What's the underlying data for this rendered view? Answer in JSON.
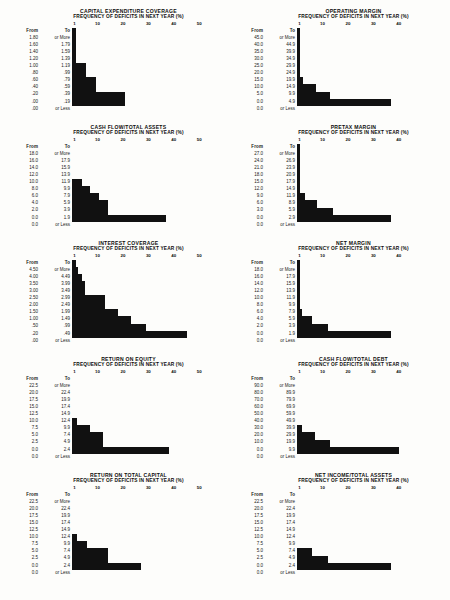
{
  "page": {
    "axis_label": "FREQUENCY OF DEFICITS IN NEXT YEAR  (%)",
    "col_from": "From",
    "col_to": "To",
    "or_more": "or More",
    "or_less": "or Less",
    "bar_color": "#111111",
    "background": "#fdfdfb"
  },
  "chart_data": [
    {
      "id": "capital-expenditure-coverage",
      "type": "bar",
      "orientation": "horizontal",
      "title": "CAPITAL EXPENDITURE COVERAGE",
      "subtitle": "FREQUENCY OF DEFICITS IN NEXT YEAR  (%)",
      "xlabel": "FREQUENCY OF DEFICITS IN NEXT YEAR (%)",
      "ylabel": "",
      "xlim": [
        0,
        55
      ],
      "ticks": [
        1,
        10,
        20,
        30,
        40,
        50
      ],
      "grid": false,
      "categories": [
        {
          "from": "1.80",
          "to": "or More"
        },
        {
          "from": "1.60",
          "to": "1.79"
        },
        {
          "from": "1.40",
          "to": "1.59"
        },
        {
          "from": "1.20",
          "to": "1.39"
        },
        {
          "from": "1.00",
          "to": "1.19"
        },
        {
          "from": ".80",
          "to": ".99"
        },
        {
          "from": ".60",
          "to": ".79"
        },
        {
          "from": ".40",
          "to": ".59"
        },
        {
          "from": ".20",
          "to": ".39"
        },
        {
          "from": ".00",
          "to": ".19"
        },
        {
          "from": ".00",
          "to": "or Less"
        }
      ],
      "values": [
        1.5,
        1.5,
        1.5,
        1.5,
        1.5,
        5.5,
        5.5,
        9.5,
        9.5,
        21,
        21
      ]
    },
    {
      "id": "operating-margin",
      "type": "bar",
      "orientation": "horizontal",
      "title": "OPERATING MARGIN",
      "subtitle": "FREQUENCY OF DEFICITS IN NEXT YEAR  (%)",
      "xlabel": "FREQUENCY OF DEFICITS IN NEXT YEAR (%)",
      "ylabel": "",
      "xlim": [
        0,
        55
      ],
      "ticks": [
        1,
        10,
        20,
        30,
        40
      ],
      "grid": false,
      "categories": [
        {
          "from": "45.0",
          "to": "or More"
        },
        {
          "from": "40.0",
          "to": "44.9"
        },
        {
          "from": "35.0",
          "to": "39.9"
        },
        {
          "from": "30.0",
          "to": "34.9"
        },
        {
          "from": "25.0",
          "to": "29.9"
        },
        {
          "from": "20.0",
          "to": "24.9"
        },
        {
          "from": "15.0",
          "to": "19.9"
        },
        {
          "from": "10.0",
          "to": "14.9"
        },
        {
          "from": "5.0",
          "to": "9.9"
        },
        {
          "from": "0.0",
          "to": "4.9"
        },
        {
          "from": "0.0",
          "to": "or Less"
        }
      ],
      "values": [
        1.2,
        1.2,
        1.2,
        1.2,
        1.2,
        1.2,
        1.2,
        2.5,
        7.5,
        13,
        37
      ]
    },
    {
      "id": "cash-flow-total-assets",
      "type": "bar",
      "orientation": "horizontal",
      "title": "CASH FLOW/TOTAL ASSETS",
      "subtitle": "FREQUENCY OF DEFICITS IN NEXT YEAR  (%)",
      "xlabel": "FREQUENCY OF DEFICITS IN NEXT YEAR (%)",
      "ylabel": "",
      "xlim": [
        0,
        55
      ],
      "ticks": [
        1,
        10,
        20,
        30,
        40,
        50
      ],
      "grid": false,
      "categories": [
        {
          "from": "18.0",
          "to": "or More"
        },
        {
          "from": "16.0",
          "to": "17.9"
        },
        {
          "from": "14.0",
          "to": "15.9"
        },
        {
          "from": "12.0",
          "to": "13.9"
        },
        {
          "from": "10.0",
          "to": "11.9"
        },
        {
          "from": "8.0",
          "to": "9.9"
        },
        {
          "from": "6.0",
          "to": "7.9"
        },
        {
          "from": "4.0",
          "to": "5.9"
        },
        {
          "from": "2.0",
          "to": "3.9"
        },
        {
          "from": "0.0",
          "to": "1.9"
        },
        {
          "from": "0.0",
          "to": "or Less"
        }
      ],
      "values": [
        0,
        0,
        0,
        0,
        0,
        4,
        7,
        10.5,
        14,
        14,
        37
      ]
    },
    {
      "id": "pretax-margin",
      "type": "bar",
      "orientation": "horizontal",
      "title": "PRETAX MARGIN",
      "subtitle": "FREQUENCY OF DEFICITS IN NEXT YEAR  (%)",
      "xlabel": "FREQUENCY OF DEFICITS IN NEXT YEAR (%)",
      "ylabel": "",
      "xlim": [
        0,
        55
      ],
      "ticks": [
        1,
        10,
        20,
        30,
        40
      ],
      "grid": false,
      "categories": [
        {
          "from": "27.0",
          "to": "or More"
        },
        {
          "from": "24.0",
          "to": "26.9"
        },
        {
          "from": "21.0",
          "to": "23.9"
        },
        {
          "from": "18.0",
          "to": "20.9"
        },
        {
          "from": "15.0",
          "to": "17.9"
        },
        {
          "from": "12.0",
          "to": "14.9"
        },
        {
          "from": "9.0",
          "to": "11.9"
        },
        {
          "from": "6.0",
          "to": "8.9"
        },
        {
          "from": "3.0",
          "to": "5.9"
        },
        {
          "from": "0.0",
          "to": "2.9"
        },
        {
          "from": "0.0",
          "to": "or Less"
        }
      ],
      "values": [
        1.2,
        1.2,
        1.2,
        1.2,
        1.2,
        1.2,
        1.2,
        3,
        8,
        14,
        37
      ]
    },
    {
      "id": "interest-coverage",
      "type": "bar",
      "orientation": "horizontal",
      "title": "INTEREST COVERAGE",
      "subtitle": "FREQUENCY OF DEFICITS IN NEXT YEAR  (%)",
      "xlabel": "FREQUENCY OF DEFICITS IN NEXT YEAR (%)",
      "ylabel": "",
      "xlim": [
        0,
        55
      ],
      "ticks": [
        1,
        10,
        20,
        30,
        40,
        50
      ],
      "grid": false,
      "categories": [
        {
          "from": "4.50",
          "to": "or More"
        },
        {
          "from": "4.00",
          "to": "4.49"
        },
        {
          "from": "3.50",
          "to": "3.99"
        },
        {
          "from": "3.00",
          "to": "3.49"
        },
        {
          "from": "2.50",
          "to": "2.99"
        },
        {
          "from": "2.00",
          "to": "2.49"
        },
        {
          "from": "1.50",
          "to": "1.99"
        },
        {
          "from": "1.00",
          "to": "1.49"
        },
        {
          "from": ".50",
          "to": ".99"
        },
        {
          "from": ".20",
          "to": ".49"
        },
        {
          "from": ".00",
          "to": "or Less"
        }
      ],
      "values": [
        1.5,
        2.5,
        4,
        5,
        5,
        13,
        13,
        18,
        23,
        29,
        45
      ]
    },
    {
      "id": "net-margin",
      "type": "bar",
      "orientation": "horizontal",
      "title": "NET MARGIN",
      "subtitle": "FREQUENCY OF DEFICITS IN NEXT YEAR  (%)",
      "xlabel": "FREQUENCY OF DEFICITS IN NEXT YEAR (%)",
      "ylabel": "",
      "xlim": [
        0,
        55
      ],
      "ticks": [
        1,
        10,
        20,
        30,
        40
      ],
      "grid": false,
      "categories": [
        {
          "from": "18.0",
          "to": "or More"
        },
        {
          "from": "16.0",
          "to": "17.9"
        },
        {
          "from": "14.0",
          "to": "15.9"
        },
        {
          "from": "12.0",
          "to": "13.9"
        },
        {
          "from": "10.0",
          "to": "11.9"
        },
        {
          "from": "8.0",
          "to": "9.9"
        },
        {
          "from": "6.0",
          "to": "7.9"
        },
        {
          "from": "4.0",
          "to": "5.9"
        },
        {
          "from": "2.0",
          "to": "3.9"
        },
        {
          "from": "0.0",
          "to": "1.9"
        },
        {
          "from": "0.0",
          "to": "or Less"
        }
      ],
      "values": [
        1.2,
        1.2,
        1.2,
        1.2,
        1.2,
        1.2,
        1.2,
        2,
        6,
        12,
        37
      ]
    },
    {
      "id": "return-on-equity",
      "type": "bar",
      "orientation": "horizontal",
      "title": "RETURN ON EQUITY",
      "subtitle": "FREQUENCY OF DEFICITS IN NEXT YEAR  (%)",
      "xlabel": "FREQUENCY OF DEFICITS IN NEXT YEAR (%)",
      "ylabel": "",
      "xlim": [
        0,
        55
      ],
      "ticks": [
        1,
        10,
        20,
        30,
        40,
        50
      ],
      "grid": false,
      "categories": [
        {
          "from": "22.5",
          "to": "or More"
        },
        {
          "from": "20.0",
          "to": "22.4"
        },
        {
          "from": "17.5",
          "to": "19.9"
        },
        {
          "from": "15.0",
          "to": "17.4"
        },
        {
          "from": "12.5",
          "to": "14.9"
        },
        {
          "from": "10.0",
          "to": "12.4"
        },
        {
          "from": "7.5",
          "to": "9.9"
        },
        {
          "from": "5.0",
          "to": "7.4"
        },
        {
          "from": "2.5",
          "to": "4.9"
        },
        {
          "from": "0.0",
          "to": "2.4"
        },
        {
          "from": "0.0",
          "to": "or Less"
        }
      ],
      "values": [
        0,
        0,
        0,
        0,
        0,
        0,
        2,
        7,
        12,
        12,
        38
      ]
    },
    {
      "id": "cash-flow-total-debt",
      "type": "bar",
      "orientation": "horizontal",
      "title": "CASH FLOW/TOTAL DEBT",
      "subtitle": "FREQUENCY OF DEFICITS IN NEXT YEAR  (%)",
      "xlabel": "FREQUENCY OF DEFICITS IN NEXT YEAR (%)",
      "ylabel": "",
      "xlim": [
        0,
        55
      ],
      "ticks": [
        1,
        10,
        20,
        30,
        40
      ],
      "grid": false,
      "categories": [
        {
          "from": "90.0",
          "to": "or More"
        },
        {
          "from": "80.0",
          "to": "89.9"
        },
        {
          "from": "70.0",
          "to": "79.9"
        },
        {
          "from": "60.0",
          "to": "69.9"
        },
        {
          "from": "50.0",
          "to": "59.9"
        },
        {
          "from": "40.0",
          "to": "49.9"
        },
        {
          "from": "30.0",
          "to": "39.9"
        },
        {
          "from": "20.0",
          "to": "29.9"
        },
        {
          "from": "10.0",
          "to": "19.9"
        },
        {
          "from": "0.0",
          "to": "9.9"
        },
        {
          "from": "0.0",
          "to": "or Less"
        }
      ],
      "values": [
        0,
        0,
        0,
        0,
        0,
        0,
        0,
        2,
        7,
        13,
        40
      ]
    },
    {
      "id": "return-on-total-capital",
      "type": "bar",
      "orientation": "horizontal",
      "title": "RETURN ON TOTAL CAPITAL",
      "subtitle": "FREQUENCY OF DEFICITS IN NEXT YEAR  (%)",
      "xlabel": "FREQUENCY OF DEFICITS IN NEXT YEAR (%)",
      "ylabel": "",
      "xlim": [
        0,
        55
      ],
      "ticks": [
        1,
        10,
        20,
        30,
        40,
        50
      ],
      "grid": false,
      "categories": [
        {
          "from": "22.5",
          "to": "or More"
        },
        {
          "from": "20.0",
          "to": "22.4"
        },
        {
          "from": "17.5",
          "to": "19.9"
        },
        {
          "from": "15.0",
          "to": "17.4"
        },
        {
          "from": "12.5",
          "to": "14.9"
        },
        {
          "from": "10.0",
          "to": "12.4"
        },
        {
          "from": "7.5",
          "to": "9.9"
        },
        {
          "from": "5.0",
          "to": "7.4"
        },
        {
          "from": "2.5",
          "to": "4.9"
        },
        {
          "from": "0.0",
          "to": "2.4"
        },
        {
          "from": "0.0",
          "to": "or Less"
        }
      ],
      "values": [
        0,
        0,
        0,
        0,
        0,
        0,
        2,
        6,
        14,
        14,
        27
      ]
    },
    {
      "id": "net-income-total-assets",
      "type": "bar",
      "orientation": "horizontal",
      "title": "NET INCOME/TOTAL ASSETS",
      "subtitle": "FREQUENCY OF DEFICITS IN NEXT YEAR  (%)",
      "xlabel": "FREQUENCY OF DEFICITS IN NEXT YEAR (%)",
      "ylabel": "",
      "xlim": [
        0,
        55
      ],
      "ticks": [
        1,
        10,
        20,
        30,
        40
      ],
      "grid": false,
      "categories": [
        {
          "from": "22.5",
          "to": "or More"
        },
        {
          "from": "20.0",
          "to": "22.4"
        },
        {
          "from": "17.5",
          "to": "19.9"
        },
        {
          "from": "15.0",
          "to": "17.4"
        },
        {
          "from": "12.5",
          "to": "14.9"
        },
        {
          "from": "10.0",
          "to": "12.4"
        },
        {
          "from": "7.5",
          "to": "9.9"
        },
        {
          "from": "5.0",
          "to": "7.4"
        },
        {
          "from": "2.5",
          "to": "4.9"
        },
        {
          "from": "0.0",
          "to": "2.4"
        },
        {
          "from": "0.0",
          "to": "or Less"
        }
      ],
      "values": [
        0,
        0,
        0,
        0,
        0,
        0,
        0,
        0,
        6,
        12,
        37
      ]
    }
  ]
}
